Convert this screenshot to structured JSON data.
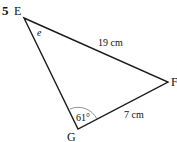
{
  "question_number": "5",
  "triangle": {
    "vertices": [
      {
        "name": "E",
        "x": 24,
        "y": 18
      },
      {
        "name": "F",
        "x": 168,
        "y": 82
      },
      {
        "name": "G",
        "x": 78,
        "y": 129
      }
    ],
    "labels": {
      "E": "E",
      "F": "F",
      "G": "G"
    },
    "sides": {
      "EF": "19 cm",
      "GF": "7 cm"
    },
    "angles": {
      "E": "e",
      "G": "61°"
    }
  }
}
